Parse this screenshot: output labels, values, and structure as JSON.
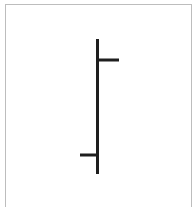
{
  "figure": {
    "type": "ohlc-bar-symbol",
    "colors": {
      "stroke": "#1e1e1e",
      "frame": "#bdbdbd",
      "background": "#ffffff"
    },
    "bar": {
      "x": 97.5,
      "high_y": 39,
      "low_y": 174,
      "open": {
        "side": "left",
        "y": 155,
        "x_start": 80
      },
      "close": {
        "side": "right",
        "y": 60,
        "x_end": 119
      }
    }
  }
}
